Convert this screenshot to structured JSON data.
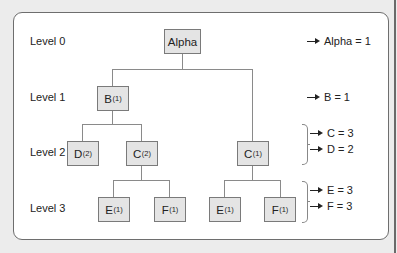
{
  "levels": [
    {
      "label": "Level 0"
    },
    {
      "label": "Level 1"
    },
    {
      "label": "Level 2"
    },
    {
      "label": "Level 3"
    }
  ],
  "nodes": {
    "alpha": {
      "name": "Alpha",
      "sub": ""
    },
    "b": {
      "name": "B",
      "sub": "(1)"
    },
    "d_left": {
      "name": "D",
      "sub": "(2)"
    },
    "c_left": {
      "name": "C",
      "sub": "(2)"
    },
    "e_left": {
      "name": "E",
      "sub": "(1)"
    },
    "f_left": {
      "name": "F",
      "sub": "(1)"
    },
    "c_right": {
      "name": "C",
      "sub": "(1)"
    },
    "e_right": {
      "name": "E",
      "sub": "(1)"
    },
    "f_right": {
      "name": "F",
      "sub": "(1)"
    }
  },
  "totals": [
    {
      "text": "Alpha = 1"
    },
    {
      "text": "B = 1"
    },
    {
      "text": "C = 3"
    },
    {
      "text": "D = 2"
    },
    {
      "text": "E = 3"
    },
    {
      "text": "F = 3"
    }
  ],
  "colors": {
    "node_fill": "#e4e4e4",
    "node_border": "#7a7a7a",
    "connector": "#8a8a8a",
    "panel_border": "#6e6e6e",
    "background": "#ececec"
  }
}
